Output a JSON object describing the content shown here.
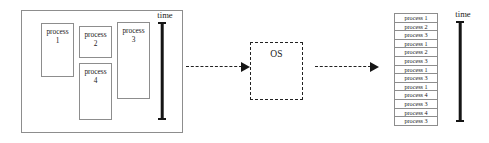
{
  "diagram": {
    "title_text": "",
    "left_panel": {
      "name": "process pool",
      "processes": [
        {
          "label": "process",
          "number": "1"
        },
        {
          "label": "process",
          "number": "2"
        },
        {
          "label": "process",
          "number": "3"
        },
        {
          "label": "process",
          "number": "4"
        }
      ],
      "time_axis_label": "time"
    },
    "os": {
      "label": "OS"
    },
    "arrows": [
      {
        "name": "arrow-to-os",
        "style": "dashed",
        "direction": "right"
      },
      {
        "name": "arrow-from-os",
        "style": "dashed",
        "direction": "right"
      }
    ],
    "right_panel": {
      "name": "execution schedule",
      "time_axis_label": "time",
      "rows": [
        "process 1",
        "process 2",
        "process 3",
        "process 1",
        "process 2",
        "process 3",
        "process 1",
        "process 3",
        "process 1",
        "process 4",
        "process 3",
        "process 4",
        "process 3"
      ]
    },
    "colors": {
      "box_border": "#8d8d8d",
      "dashed_border": "#222222",
      "axis": "#151515",
      "background": "#ffffff",
      "text": "#1a1a1a"
    }
  }
}
